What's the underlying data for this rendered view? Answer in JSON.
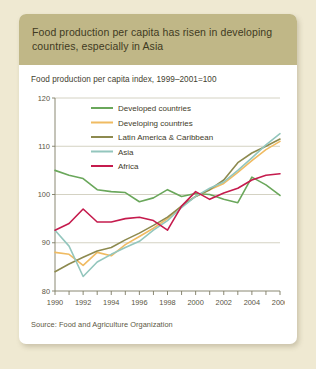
{
  "card": {
    "title": "Food production per capita has risen in developing countries, especially in Asia",
    "subtitle": "Food production per capita index, 1999–2001=100",
    "source": "Source: Food and Agriculture Organization"
  },
  "chart_data": {
    "type": "line",
    "title": "Food production per capita index, 1999–2001=100",
    "xlabel": "",
    "ylabel": "",
    "xlim": [
      1990,
      2006
    ],
    "ylim": [
      80,
      120
    ],
    "yticks": [
      80,
      90,
      100,
      110,
      120
    ],
    "xticks": [
      1990,
      1991,
      1992,
      1993,
      1994,
      1995,
      1996,
      1997,
      1998,
      1999,
      2000,
      2001,
      2002,
      2003,
      2004,
      2005,
      2006
    ],
    "xtick_labels": [
      "1990",
      "",
      "1992",
      "",
      "1994",
      "",
      "1996",
      "",
      "1998",
      "",
      "2000",
      "",
      "2002",
      "",
      "2004",
      "",
      "2006"
    ],
    "grid": "horizontal",
    "legend_position": "top-center",
    "x": [
      1990,
      1991,
      1992,
      1993,
      1994,
      1995,
      1996,
      1997,
      1998,
      1999,
      2000,
      2001,
      2002,
      2003,
      2004,
      2005,
      2006
    ],
    "series": [
      {
        "name": "Developed countries",
        "color": "#6aa75b",
        "values": [
          105.0,
          104.0,
          103.3,
          101.0,
          100.6,
          100.4,
          98.5,
          99.3,
          101.0,
          99.6,
          100.2,
          100.0,
          99.0,
          98.3,
          103.6,
          102.0,
          99.8
        ]
      },
      {
        "name": "Developing countries",
        "color": "#f0bb62",
        "values": [
          88.0,
          87.6,
          85.3,
          88.0,
          87.3,
          89.6,
          91.3,
          93.0,
          95.0,
          97.6,
          99.6,
          101.0,
          102.3,
          104.6,
          107.0,
          109.3,
          111.0
        ]
      },
      {
        "name": "Latin America & Caribbean",
        "color": "#8d8a4f",
        "values": [
          84.0,
          85.6,
          87.0,
          88.3,
          89.0,
          90.6,
          92.0,
          93.6,
          95.3,
          97.6,
          99.6,
          101.0,
          103.0,
          106.6,
          108.6,
          110.0,
          111.5
        ]
      },
      {
        "name": "Asia",
        "color": "#93c6bd",
        "values": [
          92.6,
          89.3,
          83.0,
          86.0,
          87.6,
          89.0,
          90.3,
          92.6,
          94.6,
          97.3,
          99.6,
          101.3,
          102.6,
          105.0,
          107.6,
          110.3,
          112.6
        ]
      },
      {
        "name": "Africa",
        "color": "#c51b4d",
        "values": [
          92.6,
          94.0,
          97.0,
          94.3,
          94.3,
          95.0,
          95.3,
          94.6,
          92.6,
          97.6,
          100.6,
          99.0,
          100.3,
          101.3,
          103.0,
          104.0,
          104.3
        ]
      }
    ]
  }
}
